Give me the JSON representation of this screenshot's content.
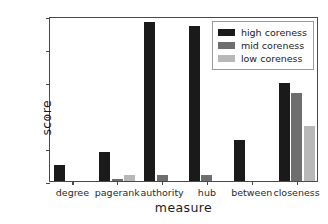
{
  "chart_data": {
    "type": "bar",
    "title": "",
    "xlabel": "measure",
    "ylabel": "score",
    "categories": [
      "degree",
      "pagerank",
      "authority",
      "hub",
      "between",
      "closeness"
    ],
    "series": [
      {
        "name": "high coreness",
        "color": "#1a1a1a",
        "values": [
          0.048,
          0.088,
          0.481,
          0.47,
          0.123,
          0.298
        ]
      },
      {
        "name": "mid coreness",
        "color": "#6e6e6e",
        "values": [
          0.0,
          0.007,
          0.017,
          0.017,
          0.0,
          0.268
        ]
      },
      {
        "name": "low coreness",
        "color": "#b8b8b8",
        "values": [
          0.0,
          0.018,
          0.0,
          0.0,
          0.0,
          0.166
        ]
      }
    ],
    "ylim": [
      0.0,
      0.5
    ],
    "yticks": [
      "0.0",
      "0.1",
      "0.2",
      "0.3",
      "0.4",
      "0.5"
    ],
    "ytick_values": [
      0.0,
      0.1,
      0.2,
      0.3,
      0.4,
      0.5
    ],
    "grid": false,
    "legend_position": "top right"
  },
  "legend": {
    "entries": [
      {
        "label": "high coreness"
      },
      {
        "label": "mid coreness"
      },
      {
        "label": "low coreness"
      }
    ]
  }
}
